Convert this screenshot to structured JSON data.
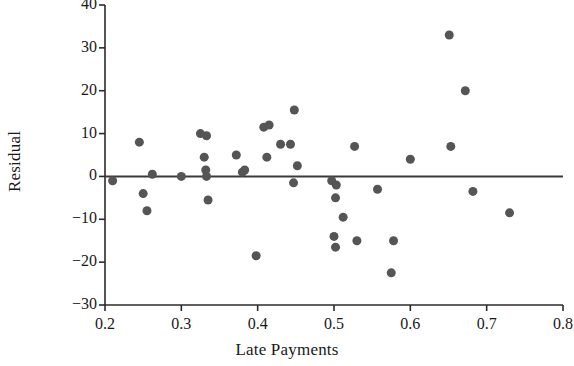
{
  "chart_data": {
    "type": "scatter",
    "title": "",
    "xlabel": "Late Payments",
    "ylabel": "Residual",
    "xlim": [
      0.2,
      0.8
    ],
    "ylim": [
      -30,
      40
    ],
    "xticks": [
      0.2,
      0.3,
      0.4,
      0.5,
      0.6,
      0.7,
      0.8
    ],
    "xtick_labels": [
      "0.2",
      "0.3",
      "0.4",
      "0.5",
      "0.6",
      "0.7",
      "0.8"
    ],
    "yticks": [
      -30,
      -20,
      -10,
      0,
      10,
      20,
      30,
      40
    ],
    "ytick_labels": [
      "−30",
      "−20",
      "−10",
      "0",
      "10",
      "20",
      "30",
      "40"
    ],
    "grid": false,
    "legend": null,
    "reference_line": {
      "orientation": "horizontal",
      "y": 0,
      "color": "#3a3a3a",
      "width": 2
    },
    "marker": {
      "shape": "circle",
      "color": "#555555",
      "size": 9
    },
    "points": [
      {
        "x": 0.21,
        "y": -1.0
      },
      {
        "x": 0.245,
        "y": 8.0
      },
      {
        "x": 0.25,
        "y": -4.0
      },
      {
        "x": 0.255,
        "y": -8.0
      },
      {
        "x": 0.262,
        "y": 0.5
      },
      {
        "x": 0.3,
        "y": 0.0
      },
      {
        "x": 0.325,
        "y": 10.0
      },
      {
        "x": 0.333,
        "y": 9.5
      },
      {
        "x": 0.33,
        "y": 4.5
      },
      {
        "x": 0.332,
        "y": 1.5
      },
      {
        "x": 0.333,
        "y": 0.0
      },
      {
        "x": 0.335,
        "y": -5.5
      },
      {
        "x": 0.372,
        "y": 5.0
      },
      {
        "x": 0.38,
        "y": 1.0
      },
      {
        "x": 0.383,
        "y": 1.5
      },
      {
        "x": 0.398,
        "y": -18.5
      },
      {
        "x": 0.408,
        "y": 11.5
      },
      {
        "x": 0.415,
        "y": 12.0
      },
      {
        "x": 0.412,
        "y": 4.5
      },
      {
        "x": 0.43,
        "y": 7.5
      },
      {
        "x": 0.448,
        "y": 15.5
      },
      {
        "x": 0.443,
        "y": 7.5
      },
      {
        "x": 0.452,
        "y": 2.5
      },
      {
        "x": 0.447,
        "y": -1.5
      },
      {
        "x": 0.497,
        "y": -1.0
      },
      {
        "x": 0.503,
        "y": -2.0
      },
      {
        "x": 0.502,
        "y": -5.0
      },
      {
        "x": 0.512,
        "y": -9.5
      },
      {
        "x": 0.5,
        "y": -14.0
      },
      {
        "x": 0.502,
        "y": -16.5
      },
      {
        "x": 0.527,
        "y": 7.0
      },
      {
        "x": 0.53,
        "y": -15.0
      },
      {
        "x": 0.557,
        "y": -3.0
      },
      {
        "x": 0.575,
        "y": -22.5
      },
      {
        "x": 0.578,
        "y": -15.0
      },
      {
        "x": 0.6,
        "y": 4.0
      },
      {
        "x": 0.651,
        "y": 33.0
      },
      {
        "x": 0.672,
        "y": 20.0
      },
      {
        "x": 0.653,
        "y": 7.0
      },
      {
        "x": 0.682,
        "y": -3.5
      },
      {
        "x": 0.73,
        "y": -8.5
      }
    ]
  },
  "axes": {
    "left_spine": true,
    "bottom_spine": true,
    "tick_direction": "out"
  }
}
